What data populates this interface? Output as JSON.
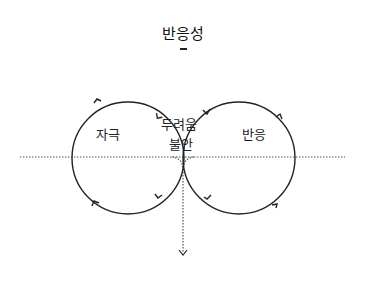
{
  "diagram": {
    "title": "반응성",
    "sets": [
      {
        "id": "left",
        "label": "자극"
      },
      {
        "id": "right",
        "label": "반응"
      }
    ],
    "intersection": {
      "line1": "두려움",
      "line2": "불안"
    },
    "colors": {
      "stroke": "#222222",
      "dotted": "#555555",
      "background": "#ffffff"
    }
  }
}
